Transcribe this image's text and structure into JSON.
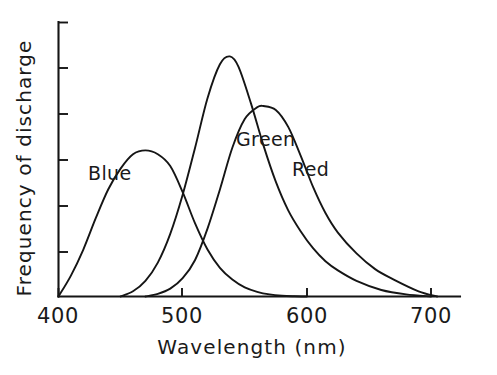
{
  "chart_data": {
    "type": "line",
    "title": "",
    "xlabel": "Wavelength (nm)",
    "ylabel": "Frequency of discharge",
    "xlim": [
      390,
      715
    ],
    "ylim": [
      0,
      1.05
    ],
    "xticks": [
      400,
      500,
      600,
      700
    ],
    "xtick_labels": [
      "400",
      "500",
      "600",
      "700"
    ],
    "yticks": [
      0,
      0.2,
      0.4,
      0.6,
      0.8,
      1.0
    ],
    "ytick_labels": [
      "",
      "",
      "",
      "",
      "",
      ""
    ],
    "grid": false,
    "legend_position": "inline-annotations",
    "annotations": [
      {
        "text": "Blue",
        "x": 425,
        "y": 0.69
      },
      {
        "text": "Green",
        "x": 545,
        "y": 0.82
      },
      {
        "text": "Red",
        "x": 590,
        "y": 0.71
      }
    ],
    "series": [
      {
        "name": "Blue",
        "label": "Blue",
        "color": "#151515",
        "peak_x": 470,
        "peak_y": 0.56,
        "x": [
          400,
          410,
          420,
          430,
          440,
          450,
          460,
          470,
          480,
          490,
          500,
          510,
          520,
          530,
          540,
          550,
          560,
          570,
          580,
          590,
          600
        ],
        "y": [
          0.0,
          0.08,
          0.18,
          0.3,
          0.41,
          0.49,
          0.545,
          0.56,
          0.545,
          0.5,
          0.4,
          0.28,
          0.18,
          0.11,
          0.065,
          0.035,
          0.018,
          0.008,
          0.003,
          0.001,
          0.0
        ]
      },
      {
        "name": "Green",
        "label": "Green",
        "color": "#151515",
        "peak_x": 538,
        "peak_y": 0.92,
        "x": [
          450,
          460,
          470,
          480,
          490,
          500,
          510,
          520,
          530,
          538,
          545,
          555,
          565,
          575,
          585,
          595,
          605,
          615,
          625,
          640,
          660,
          680,
          700
        ],
        "y": [
          0.0,
          0.02,
          0.06,
          0.13,
          0.24,
          0.39,
          0.57,
          0.76,
          0.89,
          0.92,
          0.88,
          0.74,
          0.58,
          0.44,
          0.33,
          0.25,
          0.185,
          0.135,
          0.1,
          0.06,
          0.025,
          0.008,
          0.0
        ]
      },
      {
        "name": "Red",
        "label": "Red",
        "color": "#151515",
        "peak_x": 565,
        "peak_y": 0.73,
        "x": [
          470,
          480,
          490,
          500,
          510,
          520,
          530,
          540,
          550,
          560,
          565,
          575,
          585,
          595,
          605,
          615,
          625,
          640,
          655,
          670,
          690,
          705
        ],
        "y": [
          0.0,
          0.01,
          0.03,
          0.07,
          0.14,
          0.26,
          0.41,
          0.57,
          0.68,
          0.725,
          0.73,
          0.715,
          0.65,
          0.54,
          0.42,
          0.32,
          0.245,
          0.165,
          0.105,
          0.065,
          0.02,
          0.0
        ]
      }
    ]
  },
  "figure": {
    "background_color": "#ffffff",
    "line_color": "#151515"
  }
}
